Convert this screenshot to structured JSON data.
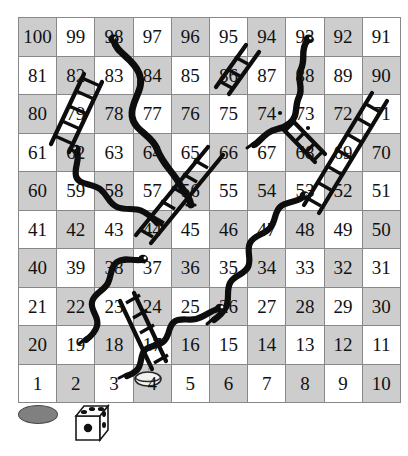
{
  "game": {
    "name": "snakes-and-ladders",
    "grid": {
      "rows": 10,
      "cols": 10,
      "numbering": "boustrophedon-bottom-left-start"
    },
    "colors": {
      "cell_light": "#ffffff",
      "cell_dark": "#cdcdcd",
      "grid_line": "#888888",
      "ink": "#111111",
      "token_offboard_fill": "#808080",
      "token_onboard_fill": "#f2f2f2",
      "die_face": "#ffffff",
      "die_pip": "#111111"
    },
    "rows": [
      {
        "index": 10,
        "cells": [
          100,
          99,
          98,
          97,
          96,
          95,
          94,
          93,
          92,
          91
        ],
        "first_shade": "dark"
      },
      {
        "index": 9,
        "cells": [
          81,
          82,
          83,
          84,
          85,
          86,
          87,
          88,
          89,
          90
        ],
        "first_shade": "light"
      },
      {
        "index": 8,
        "cells": [
          80,
          79,
          78,
          77,
          76,
          75,
          74,
          73,
          72,
          71
        ],
        "first_shade": "dark"
      },
      {
        "index": 7,
        "cells": [
          61,
          62,
          63,
          64,
          65,
          66,
          67,
          68,
          69,
          70
        ],
        "first_shade": "light"
      },
      {
        "index": 6,
        "cells": [
          60,
          59,
          58,
          57,
          56,
          55,
          54,
          53,
          52,
          51
        ],
        "first_shade": "dark"
      },
      {
        "index": 5,
        "cells": [
          41,
          42,
          43,
          44,
          45,
          46,
          47,
          48,
          49,
          50
        ],
        "first_shade": "light"
      },
      {
        "index": 4,
        "cells": [
          40,
          39,
          38,
          37,
          36,
          35,
          34,
          33,
          32,
          31
        ],
        "first_shade": "dark"
      },
      {
        "index": 3,
        "cells": [
          21,
          22,
          23,
          24,
          25,
          26,
          27,
          28,
          29,
          30
        ],
        "first_shade": "light"
      },
      {
        "index": 2,
        "cells": [
          20,
          19,
          18,
          17,
          16,
          15,
          14,
          13,
          12,
          11
        ],
        "first_shade": "dark"
      },
      {
        "index": 1,
        "cells": [
          1,
          2,
          3,
          4,
          5,
          6,
          7,
          8,
          9,
          10
        ],
        "first_shade": "light"
      }
    ],
    "snakes": [
      {
        "name": "snake-98-65",
        "head": 98,
        "tail": 65
      },
      {
        "name": "snake-93-74",
        "head": 93,
        "tail": 74
      },
      {
        "name": "snake-62-43",
        "head": 62,
        "tail": 43
      },
      {
        "name": "snake-53-27",
        "head": 53,
        "tail": 27
      },
      {
        "name": "snake-37-19",
        "head": 37,
        "tail": 19
      },
      {
        "name": "snake-29-7",
        "head": 29,
        "tail": 7
      }
    ],
    "ladders": [
      {
        "name": "ladder-60-82",
        "bottom": 60,
        "top": 82
      },
      {
        "name": "ladder-86-94",
        "bottom": 86,
        "top": 94
      },
      {
        "name": "ladder-51-88",
        "bottom": 51,
        "top": 88
      },
      {
        "name": "ladder-22-41",
        "bottom": 22,
        "top": 41
      },
      {
        "name": "ladder-36-55",
        "bottom": 36,
        "top": 55
      },
      {
        "name": "ladder-32-48",
        "bottom": 32,
        "top": 48
      },
      {
        "name": "ladder-6-24",
        "bottom": 6,
        "top": 24
      }
    ],
    "tokens": [
      {
        "name": "token-on-board",
        "location_cell": 4,
        "color": "#f2f2f2"
      },
      {
        "name": "token-off-board",
        "location_cell": null,
        "color": "#808080"
      }
    ],
    "die": {
      "name": "die",
      "front_face_value": 1,
      "top_face_value": 3,
      "left_face_value": 2
    }
  }
}
